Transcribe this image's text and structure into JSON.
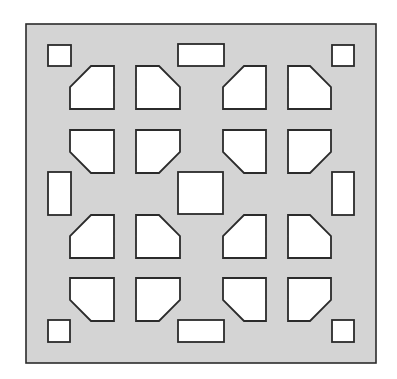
{
  "diagram": {
    "colors": {
      "panel_fill": "#d4d4d4",
      "hole_fill": "#ffffff",
      "stroke": "#2b2b2b",
      "background": "#ffffff"
    },
    "panel": {
      "x": 26,
      "y": 24,
      "w": 350,
      "h": 339
    },
    "small_squares": [
      {
        "id": "top-left",
        "x": 48,
        "y": 45,
        "w": 23,
        "h": 21
      },
      {
        "id": "top-right",
        "x": 332,
        "y": 45,
        "w": 22,
        "h": 21
      },
      {
        "id": "bottom-left",
        "x": 48,
        "y": 320,
        "w": 22,
        "h": 22
      },
      {
        "id": "bottom-right",
        "x": 332,
        "y": 320,
        "w": 22,
        "h": 22
      }
    ],
    "rects": [
      {
        "id": "top-center",
        "x": 178,
        "y": 44,
        "w": 46,
        "h": 22
      },
      {
        "id": "bottom-center",
        "x": 178,
        "y": 320,
        "w": 46,
        "h": 22
      },
      {
        "id": "left-middle",
        "x": 48,
        "y": 172,
        "w": 23,
        "h": 43
      },
      {
        "id": "right-middle",
        "x": 332,
        "y": 172,
        "w": 22,
        "h": 43
      },
      {
        "id": "center",
        "x": 178,
        "y": 172,
        "w": 45,
        "h": 42
      }
    ],
    "chamfered": [
      {
        "x": 70,
        "y": 66,
        "w": 44,
        "h": 43,
        "corner": "tl"
      },
      {
        "x": 136,
        "y": 66,
        "w": 44,
        "h": 43,
        "corner": "tr"
      },
      {
        "x": 223,
        "y": 66,
        "w": 43,
        "h": 43,
        "corner": "tl"
      },
      {
        "x": 288,
        "y": 66,
        "w": 43,
        "h": 43,
        "corner": "tr"
      },
      {
        "x": 70,
        "y": 130,
        "w": 44,
        "h": 43,
        "corner": "bl"
      },
      {
        "x": 136,
        "y": 130,
        "w": 44,
        "h": 43,
        "corner": "br"
      },
      {
        "x": 223,
        "y": 130,
        "w": 43,
        "h": 43,
        "corner": "bl"
      },
      {
        "x": 288,
        "y": 130,
        "w": 43,
        "h": 43,
        "corner": "br"
      },
      {
        "x": 70,
        "y": 215,
        "w": 44,
        "h": 43,
        "corner": "tl"
      },
      {
        "x": 136,
        "y": 215,
        "w": 44,
        "h": 43,
        "corner": "tr"
      },
      {
        "x": 223,
        "y": 215,
        "w": 43,
        "h": 43,
        "corner": "tl"
      },
      {
        "x": 288,
        "y": 215,
        "w": 43,
        "h": 43,
        "corner": "tr"
      },
      {
        "x": 70,
        "y": 278,
        "w": 44,
        "h": 43,
        "corner": "bl"
      },
      {
        "x": 136,
        "y": 278,
        "w": 44,
        "h": 43,
        "corner": "br"
      },
      {
        "x": 223,
        "y": 278,
        "w": 43,
        "h": 43,
        "corner": "bl"
      },
      {
        "x": 288,
        "y": 278,
        "w": 43,
        "h": 43,
        "corner": "br"
      }
    ],
    "chamfer_size": 21
  }
}
